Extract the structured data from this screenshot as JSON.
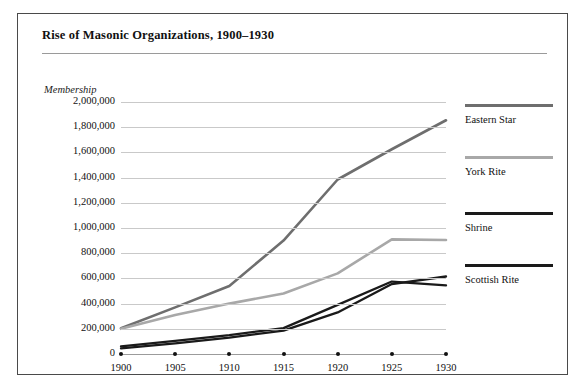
{
  "figure": {
    "title": "Rise of Masonic Organizations, 1900–1930",
    "ylabel": "Membership"
  },
  "legend": {
    "position": "right",
    "entries": [
      {
        "label": "Eastern Star",
        "color": "#6e6e6e",
        "top": 0
      },
      {
        "label": "York Rite",
        "color": "#a8a8a8",
        "top": 52
      },
      {
        "label": "Shrine",
        "color": "#1a1a1a",
        "top": 108
      },
      {
        "label": "Scottish Rite",
        "color": "#1a1a1a",
        "top": 160
      }
    ]
  },
  "chart_data": {
    "type": "line",
    "title": "Rise of Masonic Organizations, 1900–1930",
    "xlabel": "",
    "ylabel": "Membership",
    "x": [
      1900,
      1905,
      1910,
      1915,
      1920,
      1925,
      1930
    ],
    "xlim": [
      1900,
      1930
    ],
    "ylim": [
      0,
      2000000
    ],
    "xticks": [
      "1900",
      "1905",
      "1910",
      "1915",
      "1920",
      "1925",
      "1930"
    ],
    "yticks": [
      "0",
      "200,000",
      "400,000",
      "600,000",
      "800,000",
      "1,000,000",
      "1,200,000",
      "1,400,000",
      "1,600,000",
      "1,800,000",
      "2,000,000"
    ],
    "ytick_values": [
      0,
      200000,
      400000,
      600000,
      800000,
      1000000,
      1200000,
      1400000,
      1600000,
      1800000,
      2000000
    ],
    "grid": true,
    "series": [
      {
        "name": "Eastern Star",
        "color": "#6e6e6e",
        "width": 2.6,
        "values": [
          205000,
          370000,
          540000,
          900000,
          1385000,
          1625000,
          1855000
        ]
      },
      {
        "name": "York Rite",
        "color": "#a8a8a8",
        "width": 2.6,
        "values": [
          200000,
          310000,
          400000,
          480000,
          640000,
          910000,
          905000
        ]
      },
      {
        "name": "Shrine",
        "color": "#1a1a1a",
        "width": 2.3,
        "values": [
          60000,
          105000,
          150000,
          205000,
          390000,
          575000,
          545000
        ]
      },
      {
        "name": "Scottish Rite",
        "color": "#1a1a1a",
        "width": 2.3,
        "values": [
          45000,
          85000,
          130000,
          185000,
          330000,
          555000,
          615000
        ]
      }
    ]
  }
}
